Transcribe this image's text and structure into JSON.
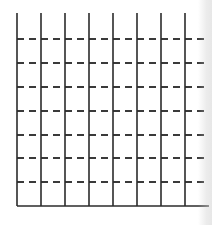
{
  "grid": {
    "stroke_color": "#2b2b2b",
    "dash_color": "#3a3a3a",
    "vertical_lines_x": [
      17,
      41,
      65,
      89,
      113,
      137,
      161,
      185
    ],
    "vertical_top_y": 13,
    "vertical_bottom_y": 206,
    "dashed_lines_y": [
      39,
      63,
      87,
      111,
      135,
      158,
      182
    ],
    "dashed_x_start": 17,
    "dashed_x_end": 208,
    "dash_pattern": "7 5",
    "baseline_y": 206,
    "baseline_x_start": 17,
    "baseline_x_end": 209,
    "columns": 8,
    "rows": 8
  }
}
